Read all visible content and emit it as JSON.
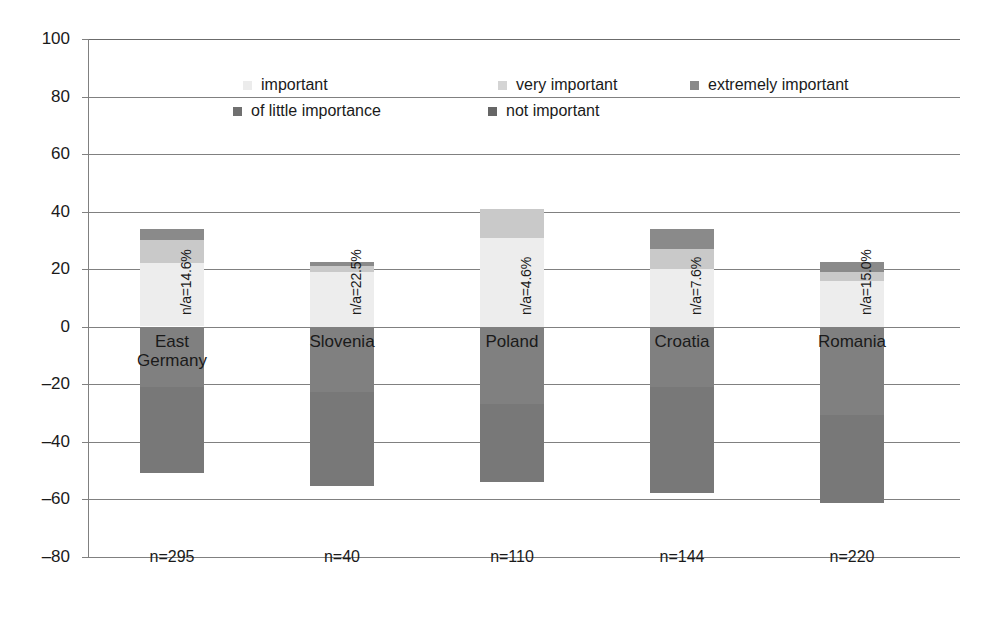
{
  "chart_data": {
    "type": "bar",
    "subtype": "diverging-stacked-bar",
    "title": "",
    "xlabel": "",
    "ylabel": "",
    "ylim": [
      -80,
      100
    ],
    "yticks": [
      100,
      80,
      60,
      40,
      20,
      0,
      "-20",
      "-40",
      "-60",
      "-80"
    ],
    "ytick_labels": [
      "100",
      "80",
      "60",
      "40",
      "20",
      "0",
      "–20",
      "–40",
      "–60",
      "–80"
    ],
    "grid": true,
    "legend_position": "top-center",
    "categories": [
      "East Germany",
      "Slovenia",
      "Poland",
      "Croatia",
      "Romania"
    ],
    "category_sublabels": [
      "n=295",
      "n=40",
      "n=110",
      "n=144",
      "n=220"
    ],
    "annotations": [
      "n/a=14.6%",
      "n/a=22.5%",
      "n/a=4.6%",
      "n/a=7.6%",
      "n/a=15.0%"
    ],
    "series": [
      {
        "name": "important",
        "direction": "positive",
        "color": "#ececec",
        "values": [
          22.0,
          19.0,
          31.0,
          20.0,
          16.0
        ]
      },
      {
        "name": "very important",
        "direction": "positive",
        "color": "#c9c9c9",
        "values": [
          8.0,
          2.0,
          10.0,
          7.0,
          3.0
        ]
      },
      {
        "name": "extremely important",
        "direction": "positive",
        "color": "#8a8a8a",
        "values": [
          4.0,
          1.5,
          0.0,
          7.0,
          3.5
        ]
      },
      {
        "name": "of little importance",
        "direction": "negative",
        "color": "#808080",
        "values": [
          -21.0,
          -22.5,
          -27.0,
          -21.0,
          -30.5
        ]
      },
      {
        "name": "not important",
        "direction": "negative",
        "color": "#787878",
        "values": [
          -30.0,
          -32.5,
          -27.0,
          -37.0,
          -30.5
        ]
      }
    ],
    "positive_totals": [
      34.0,
      22.5,
      41.0,
      34.0,
      22.5
    ],
    "negative_totals": [
      -51.0,
      -55.0,
      -54.0,
      -58.0,
      -61.0
    ]
  },
  "legend": {
    "entries": [
      {
        "label": "important",
        "color": "#ececec"
      },
      {
        "label": "very important",
        "color": "#d4d4d4"
      },
      {
        "label": "extremely important",
        "color": "#8a8a8a"
      },
      {
        "label": "of little importance",
        "color": "#707070"
      },
      {
        "label": "not important",
        "color": "#666666"
      }
    ]
  },
  "axis": {
    "y_labels": [
      "100",
      "80",
      "60",
      "40",
      "20",
      "0",
      "–20",
      "–40",
      "–60",
      "–80"
    ]
  },
  "bars": [
    {
      "name": "East Germany",
      "n": "n=295",
      "na": "n/a=14.6%",
      "segments": [
        {
          "series": "extremely important",
          "from": 30.0,
          "to": 34.0,
          "color": "#8a8a8a"
        },
        {
          "series": "very important",
          "from": 22.0,
          "to": 30.0,
          "color": "#c9c9c9"
        },
        {
          "series": "important",
          "from": 0.0,
          "to": 22.0,
          "color": "#ededed"
        },
        {
          "series": "of little importance",
          "from": -21.0,
          "to": 0.0,
          "color": "#808080"
        },
        {
          "series": "not important",
          "from": -51.0,
          "to": -21.0,
          "color": "#787878"
        }
      ]
    },
    {
      "name": "Slovenia",
      "n": "n=40",
      "na": "n/a=22.5%",
      "segments": [
        {
          "series": "extremely important",
          "from": 21.0,
          "to": 22.5,
          "color": "#8a8a8a"
        },
        {
          "series": "very important",
          "from": 19.0,
          "to": 21.0,
          "color": "#c9c9c9"
        },
        {
          "series": "important",
          "from": 0.0,
          "to": 19.0,
          "color": "#ededed"
        },
        {
          "series": "of little importance",
          "from": -22.5,
          "to": 0.0,
          "color": "#808080"
        },
        {
          "series": "not important",
          "from": -55.0,
          "to": -22.5,
          "color": "#787878"
        }
      ]
    },
    {
      "name": "Poland",
      "n": "n=110",
      "na": "n/a=4.6%",
      "segments": [
        {
          "series": "very important",
          "from": 31.0,
          "to": 41.0,
          "color": "#c9c9c9"
        },
        {
          "series": "important",
          "from": 0.0,
          "to": 31.0,
          "color": "#ededed"
        },
        {
          "series": "of little importance",
          "from": -27.0,
          "to": 0.0,
          "color": "#808080"
        },
        {
          "series": "not important",
          "from": -54.0,
          "to": -27.0,
          "color": "#787878"
        }
      ]
    },
    {
      "name": "Croatia",
      "n": "n=144",
      "na": "n/a=7.6%",
      "segments": [
        {
          "series": "extremely important",
          "from": 27.0,
          "to": 34.0,
          "color": "#8a8a8a"
        },
        {
          "series": "very important",
          "from": 20.0,
          "to": 27.0,
          "color": "#c9c9c9"
        },
        {
          "series": "important",
          "from": 0.0,
          "to": 20.0,
          "color": "#ededed"
        },
        {
          "series": "of little importance",
          "from": -21.0,
          "to": 0.0,
          "color": "#808080"
        },
        {
          "series": "not important",
          "from": -58.0,
          "to": -21.0,
          "color": "#787878"
        }
      ]
    },
    {
      "name": "Romania",
      "n": "n=220",
      "na": "n/a=15.0%",
      "segments": [
        {
          "series": "extremely important",
          "from": 19.0,
          "to": 22.5,
          "color": "#8a8a8a"
        },
        {
          "series": "very important",
          "from": 16.0,
          "to": 19.0,
          "color": "#c9c9c9"
        },
        {
          "series": "important",
          "from": 0.0,
          "to": 16.0,
          "color": "#ededed"
        },
        {
          "series": "of little importance",
          "from": -30.5,
          "to": 0.0,
          "color": "#808080"
        },
        {
          "series": "not important",
          "from": -61.0,
          "to": -30.5,
          "color": "#787878"
        }
      ]
    }
  ]
}
